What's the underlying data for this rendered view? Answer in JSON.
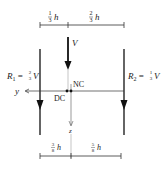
{
  "diagram": {
    "type": "shear-center-load-distribution",
    "top_dimensions": [
      {
        "num": "1",
        "den": "3",
        "var": "h"
      },
      {
        "num": "2",
        "den": "3",
        "var": "h"
      }
    ],
    "bottom_dimensions": [
      {
        "num": "3",
        "den": "8",
        "var": "h"
      },
      {
        "num": "5",
        "den": "8",
        "var": "h"
      }
    ],
    "load": {
      "label": "V"
    },
    "reactions": [
      {
        "name": "R",
        "sub": "1",
        "eq": " = ",
        "num": "2",
        "den": "3",
        "var": "V"
      },
      {
        "name": "R",
        "sub": "2",
        "eq": " = ",
        "num": "1",
        "den": "3",
        "var": "V"
      }
    ],
    "axes": {
      "y": "y",
      "z": "z"
    },
    "points": {
      "dc": "DC",
      "nc": "NC"
    },
    "colors": {
      "line": "#1a1a1a",
      "thin": "#555555",
      "background": "#ffffff"
    }
  }
}
